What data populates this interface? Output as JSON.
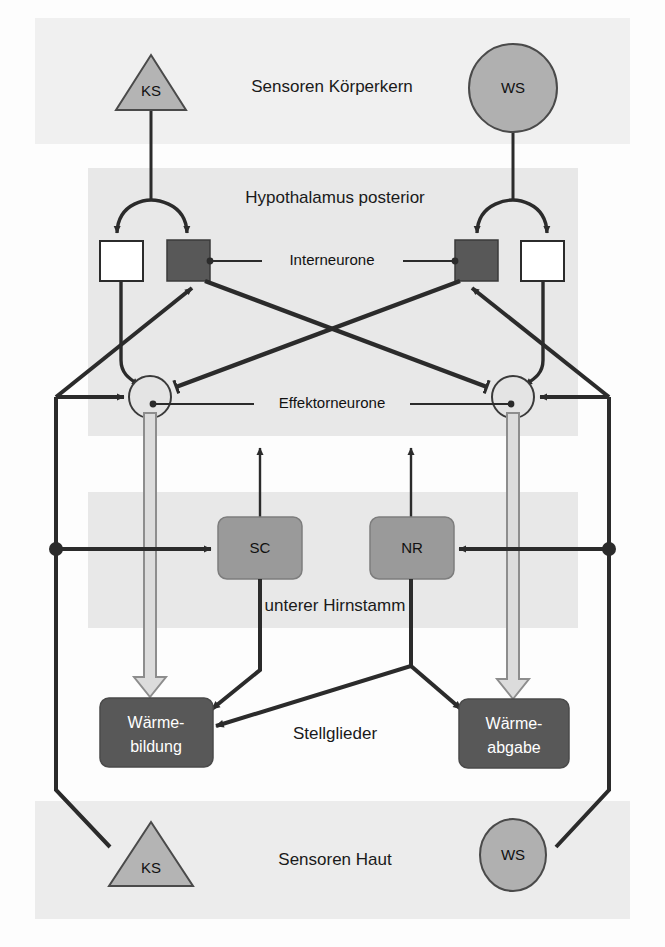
{
  "figure": {
    "background_color": "#fdfdfd",
    "band_color": "#e8e8e8"
  },
  "bands": [
    {
      "id": "koerperkern",
      "label": "Sensoren Körperkern"
    },
    {
      "id": "hypothalamus",
      "label": "Hypothalamus posterior"
    },
    {
      "id": "hirnstamm",
      "label": "unterer Hirnstamm"
    },
    {
      "id": "stellglieder",
      "label": "Stellglieder"
    },
    {
      "id": "haut",
      "label": "Sensoren Haut"
    }
  ],
  "callouts": [
    {
      "id": "interneurone",
      "label": "Interneurone"
    },
    {
      "id": "effektorneurone",
      "label": "Effektorneurone"
    }
  ],
  "sensors": {
    "core_cold": {
      "label": "KS",
      "shape": "triangle",
      "region": "Sensoren Körperkern",
      "fill": "#b4b4b4"
    },
    "core_warm": {
      "label": "WS",
      "shape": "circle",
      "region": "Sensoren Körperkern",
      "fill": "#b0b0b0"
    },
    "skin_cold": {
      "label": "KS",
      "shape": "triangle",
      "region": "Sensoren Haut",
      "fill": "#b4b4b4"
    },
    "skin_warm": {
      "label": "WS",
      "shape": "circle",
      "region": "Sensoren Haut",
      "fill": "#b0b0b0"
    }
  },
  "interneurons": [
    {
      "id": "left-white",
      "label": "",
      "fill": "#ffffff",
      "type": "excitatory-open"
    },
    {
      "id": "left-dark",
      "label": "",
      "fill": "#585858",
      "type": "inhibitory-filled"
    },
    {
      "id": "right-dark",
      "label": "",
      "fill": "#585858",
      "type": "inhibitory-filled"
    },
    {
      "id": "right-white",
      "label": "",
      "fill": "#ffffff",
      "type": "excitatory-open"
    }
  ],
  "effector_neurons": [
    {
      "id": "left-effector",
      "label": "",
      "fill": "#e2e2e2"
    },
    {
      "id": "right-effector",
      "label": "",
      "fill": "#e2e2e2"
    }
  ],
  "brainstem_nuclei": [
    {
      "id": "sc",
      "label": "SC",
      "fill": "#9a9a9a"
    },
    {
      "id": "nr",
      "label": "NR",
      "fill": "#9a9a9a"
    }
  ],
  "effectors": [
    {
      "id": "waermebildung",
      "label_line1": "Wärme-",
      "label_line2": "bildung",
      "fill": "#585858",
      "text_color": "#ffffff"
    },
    {
      "id": "waermeabgabe",
      "label_line1": "Wärme-",
      "label_line2": "abgabe",
      "fill": "#585858",
      "text_color": "#ffffff"
    }
  ],
  "colors": {
    "line": "#2b2b2b",
    "thick_line": "#3a3a3a",
    "band": "#e8e8e8",
    "node_dark": "#585858",
    "node_grey": "#9a9a9a",
    "sensor_grey": "#b4b4b4",
    "hollow_arrow_fill": "#dcdcdc",
    "hollow_arrow_stroke": "#8d8d8d"
  }
}
